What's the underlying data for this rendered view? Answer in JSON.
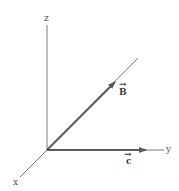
{
  "diagram": {
    "type": "3d-coordinate-axes-with-vectors",
    "colors": {
      "axis": "#7a7a7a",
      "vector": "#5a5a5a",
      "label": "#555555",
      "background": "#ffffff"
    },
    "axes": {
      "z": {
        "label": "z"
      },
      "y": {
        "label": "y"
      },
      "x": {
        "label": "x"
      }
    },
    "vectors": [
      {
        "name": "B",
        "label": "B",
        "arrow": "→",
        "direction": "diagonal (into yz-plane)"
      },
      {
        "name": "c",
        "label": "c",
        "arrow": "→",
        "direction": "along +y axis"
      }
    ]
  }
}
